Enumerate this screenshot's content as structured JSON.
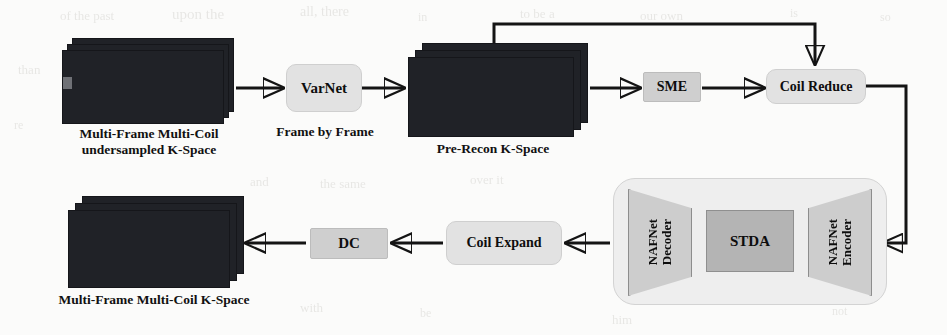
{
  "figure": {
    "colors": {
      "background": "#fbfbfa",
      "stroke": "#141414",
      "box_round_fill": "#e2e2e2",
      "box_sharp_fill": "#cfcfcf",
      "module_fill": "#eeeeee",
      "trapezoid_fill": "#cdcdcd",
      "stda_fill": "#b4b4b4",
      "text": "#111111"
    }
  },
  "inputs": {
    "undersampled_kspace": {
      "caption_line1": "Multi-Frame Multi-Coil",
      "caption_line2": "undersampled K-Space",
      "frames": 3
    }
  },
  "intermediates": {
    "pre_recon_kspace": {
      "caption": "Pre-Recon K-Space",
      "frames": 3
    }
  },
  "outputs": {
    "final_kspace": {
      "caption": "Multi-Frame Multi-Coil K-Space",
      "frames": 3
    }
  },
  "blocks": {
    "varnet": {
      "label": "VarNet",
      "sublabel": "Frame by Frame",
      "shape": "rounded"
    },
    "sme": {
      "label": "SME",
      "shape": "sharp"
    },
    "coil_reduce": {
      "label": "Coil Reduce",
      "shape": "rounded"
    },
    "coil_expand": {
      "label": "Coil Expand",
      "shape": "rounded"
    },
    "dc": {
      "label": "DC",
      "shape": "sharp"
    }
  },
  "stda_module": {
    "decoder": {
      "label_line1": "NAFNet",
      "label_line2": "Decoder",
      "shape": "trapezoid"
    },
    "core": {
      "label": "STDA",
      "shape": "rectangle"
    },
    "encoder": {
      "label_line1": "NAFNet",
      "label_line2": "Encoder",
      "shape": "trapezoid"
    }
  },
  "background_artifacts": {
    "note": "faint illegible scanner bleed-through ghost text",
    "ghosts": [
      {
        "text": "of the past",
        "x": 60,
        "y": 8,
        "size": 13
      },
      {
        "text": "upon the",
        "x": 172,
        "y": 6,
        "size": 15
      },
      {
        "text": "all, there",
        "x": 300,
        "y": 4,
        "size": 14
      },
      {
        "text": "in",
        "x": 418,
        "y": 10,
        "size": 12
      },
      {
        "text": "to be a",
        "x": 520,
        "y": 6,
        "size": 13
      },
      {
        "text": "our own",
        "x": 640,
        "y": 8,
        "size": 13
      },
      {
        "text": "is",
        "x": 790,
        "y": 6,
        "size": 12
      },
      {
        "text": "so",
        "x": 880,
        "y": 10,
        "size": 12
      },
      {
        "text": "than",
        "x": 18,
        "y": 62,
        "size": 13
      },
      {
        "text": "re",
        "x": 14,
        "y": 118,
        "size": 12
      },
      {
        "text": "and",
        "x": 250,
        "y": 174,
        "size": 13
      },
      {
        "text": "the same",
        "x": 320,
        "y": 176,
        "size": 13
      },
      {
        "text": "over it",
        "x": 470,
        "y": 172,
        "size": 13
      },
      {
        "text": "was",
        "x": 760,
        "y": 176,
        "size": 13
      },
      {
        "text": "with",
        "x": 300,
        "y": 300,
        "size": 13
      },
      {
        "text": "be",
        "x": 420,
        "y": 306,
        "size": 12
      },
      {
        "text": "him",
        "x": 612,
        "y": 312,
        "size": 13
      },
      {
        "text": "not",
        "x": 832,
        "y": 304,
        "size": 12
      }
    ]
  }
}
